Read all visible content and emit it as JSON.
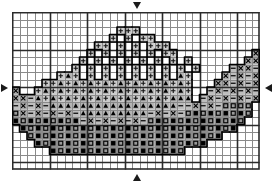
{
  "meta": {
    "width_px": 278,
    "height_px": 185
  },
  "grid": {
    "columns": 33,
    "rows": 21,
    "cell_px": 7.5,
    "origin_x": 12,
    "origin_y": 12,
    "minor_line_color": "#8a8a8a",
    "major_line_color": "#2b2b2b",
    "major_every": 5,
    "background": "#ffffff"
  },
  "center_markers": [
    {
      "name": "top-center-marker",
      "direction": "down",
      "axis": "column",
      "index": 16
    },
    {
      "name": "bottom-center-marker",
      "direction": "up",
      "axis": "column",
      "index": 16
    },
    {
      "name": "left-center-marker",
      "direction": "right",
      "axis": "row",
      "index": 10
    },
    {
      "name": "right-center-marker",
      "direction": "left",
      "axis": "row",
      "index": 10
    }
  ],
  "legend": {
    "symbols": [
      {
        "key": ".",
        "name": "dot-symbol",
        "label": "dot",
        "fill": "#e8e8e8",
        "ink": "#1a1a1a"
      },
      {
        "key": "+",
        "name": "plus-symbol",
        "label": "plus",
        "fill": "#cccccc",
        "ink": "#111111"
      },
      {
        "key": "^",
        "name": "triangle-symbol",
        "label": "filled triangle",
        "fill": "#b4b4b4",
        "ink": "#000000"
      },
      {
        "key": "x",
        "name": "cross-symbol",
        "label": "cross",
        "fill": "#a8a8a8",
        "ink": "#000000"
      },
      {
        "key": "-",
        "name": "dash-symbol",
        "label": "dash",
        "fill": "#bdbdbd",
        "ink": "#000000"
      },
      {
        "key": "o",
        "name": "open-square-symbol",
        "label": "open square",
        "fill": "#9a9a9a",
        "ink": "#000000"
      },
      {
        "key": "#",
        "name": "filled-square-symbol",
        "label": "filled square",
        "fill": "#8c8c8c",
        "ink": "#000000"
      }
    ],
    "outline_color": "#000000",
    "outline_width_px": 1.6
  },
  "chart_data": {
    "type": "heatmap",
    "xlabel": "",
    "ylabel": "",
    "grid": true,
    "legend_position": "none",
    "x": [
      1,
      2,
      3,
      4,
      5,
      6,
      7,
      8,
      9,
      10,
      11,
      12,
      13,
      14,
      15,
      16,
      17,
      18,
      19,
      20,
      21,
      22,
      23,
      24,
      25,
      26,
      27,
      28,
      29,
      30,
      31,
      32,
      33
    ],
    "y": [
      1,
      2,
      3,
      4,
      5,
      6,
      7,
      8,
      9,
      10,
      11,
      12,
      13,
      14,
      15,
      16,
      17,
      18,
      19,
      20,
      21
    ],
    "cells": [
      ".................................",
      ".................................",
      "..............+++................",
      ".............+.+.++..............",
      "...........++.+.+.+++............",
      "..........+.+.+.+.+.++..........x",
      ".........+.+.+.+.+.+.+.+.......xx",
      "........+.+.+.+.+.+.+.+.+....-xx-",
      "......+^+.+.+.+.+.+.+.^+....x-x-x",
      "....++^+^+^+^+^+^+^+^+^+...xx-x-x",
      "x..+^+^+^+^+^+^+^+^+^+^+..-x-x-x-",
      "xx-^+^+^+^+^+^+^+^+^+^^^.-x-x-x-x",
      "-x-x-^^^^^^^^^^^^^^^^^--x-x-oooo.",
      "ox-x-x-x-^^^^^^^^^-x-x-o#o#o#o#o.",
      "#o#o#o#o#-x-x-x-x-o#o#o#o#o#o#o..",
      ".#o#o#o#o#o#o#o#o#o#o#o#o#o#o#...",
      "..o#o#o#o#o#o#o#o#o#o#o#o#o#.....",
      "...#o#o#o#o#o#o#o#o#o#o#o#.......",
      ".....#o#o#o#o#o#o#o#o#o..........",
      "................................."
    ],
    "symbol_counts": {
      ".": 12,
      "+": 118,
      "^": 96,
      "x": 54,
      "-": 48,
      "o": 86,
      "#": 84
    }
  }
}
